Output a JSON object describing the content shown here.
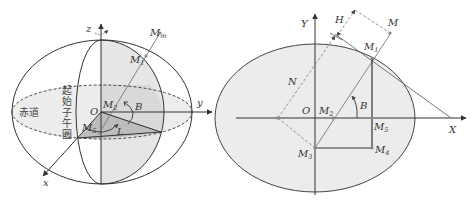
{
  "colors": {
    "line": "#333333",
    "light_fill": "#ececec",
    "mid_fill": "#d6d6d6",
    "dark_fill": "#bdbdbd",
    "dashed": "#777777",
    "point": "#888888"
  },
  "left_diagram": {
    "axes": {
      "z": "z",
      "y": "y",
      "x": "x"
    },
    "labels": {
      "origin": "O",
      "mm": "M",
      "mm_sub": "m",
      "m1": "M",
      "m1_sub": "1",
      "m2": "M",
      "m2_sub": "2",
      "m5": "M",
      "m5_sub": "5",
      "latitude": "B",
      "longitude": "L",
      "equator": "赤道",
      "prime_meridian": [
        "起",
        "始",
        "子",
        "午",
        "圈"
      ]
    }
  },
  "right_diagram": {
    "axes": {
      "x": "X",
      "y": "Y"
    },
    "labels": {
      "origin": "O",
      "height": "H",
      "normal": "N",
      "latitude": "B",
      "m": "M",
      "m1": "M",
      "m1_sub": "1",
      "m2": "M",
      "m2_sub": "2",
      "m3": "M",
      "m3_sub": "3",
      "m4": "M",
      "m4_sub": "4",
      "m5": "M",
      "m5_sub": "5"
    }
  }
}
